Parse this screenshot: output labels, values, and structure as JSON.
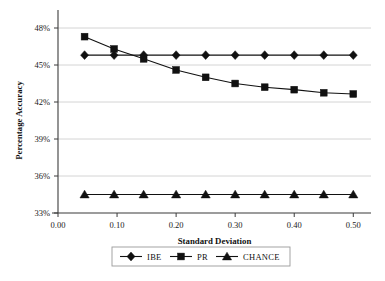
{
  "chart_data": {
    "type": "line",
    "title": "",
    "xlabel": "Standard Deviation",
    "ylabel": "Percentage Accuracy",
    "xlim": [
      0.0,
      0.53
    ],
    "ylim": [
      33,
      48
    ],
    "xticks": [
      "0.00",
      "0.10",
      "0.20",
      "0.30",
      "0.40",
      "0.50"
    ],
    "xtick_values": [
      0.0,
      0.1,
      0.2,
      0.3,
      0.4,
      0.5
    ],
    "yticks": [
      "33%",
      "36%",
      "39%",
      "42%",
      "45%",
      "48%"
    ],
    "ytick_values": [
      33,
      36,
      39,
      42,
      45,
      48
    ],
    "grid": "horizontal",
    "legend_position": "bottom",
    "x": [
      0.045,
      0.095,
      0.145,
      0.2,
      0.25,
      0.3,
      0.35,
      0.4,
      0.45,
      0.5
    ],
    "series": [
      {
        "name": "IBE",
        "marker": "diamond",
        "values": [
          45.8,
          45.8,
          45.8,
          45.8,
          45.8,
          45.8,
          45.8,
          45.8,
          45.8,
          45.8
        ]
      },
      {
        "name": "PR",
        "marker": "square",
        "values": [
          47.3,
          46.3,
          45.5,
          44.6,
          44.0,
          43.5,
          43.2,
          43.0,
          42.75,
          42.65
        ]
      },
      {
        "name": "CHANCE",
        "marker": "triangle",
        "values": [
          34.5,
          34.5,
          34.5,
          34.5,
          34.5,
          34.5,
          34.5,
          34.5,
          34.5,
          34.5
        ]
      }
    ],
    "colors": {
      "series_line": "#111111",
      "marker": "#111111",
      "grid": "#c9c9c9",
      "axis": "#3b3b3b",
      "background": "#ffffff"
    }
  },
  "legend": {
    "items": [
      {
        "label": "IBE",
        "marker": "diamond"
      },
      {
        "label": "PR",
        "marker": "square"
      },
      {
        "label": "CHANCE",
        "marker": "triangle"
      }
    ]
  }
}
